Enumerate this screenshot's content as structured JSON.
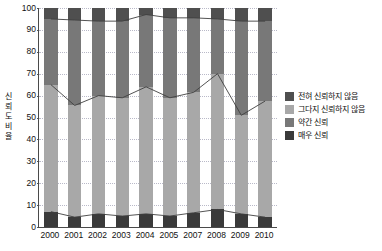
{
  "chart_data": {
    "type": "bar",
    "title": "",
    "subtitle": "",
    "xlabel": "",
    "ylabel": "신뢰도 비율",
    "ylim": [
      0,
      100
    ],
    "yticks": [
      0,
      10,
      20,
      30,
      40,
      50,
      60,
      70,
      80,
      90,
      100
    ],
    "grid": true,
    "stacked": true,
    "legend_position": "right",
    "categories": [
      "2000",
      "2001",
      "2002",
      "2003",
      "2004",
      "2005",
      "2007",
      "2008",
      "2009",
      "2010"
    ],
    "series": [
      {
        "name": "매우 신뢰",
        "color": "#3a3a3a",
        "values": [
          7,
          4.5,
          6,
          5,
          6,
          5,
          6.5,
          8,
          6,
          4.5
        ]
      },
      {
        "name": "약간 신뢰",
        "color": "#a8a8a8",
        "values": [
          58,
          51,
          54,
          54,
          58,
          54,
          55,
          62,
          45,
          53
        ]
      },
      {
        "name": "그다지 신뢰하지 않음",
        "color": "#787878",
        "values": [
          30,
          39,
          34,
          35,
          33,
          36.5,
          34,
          25,
          43,
          36.5
        ]
      },
      {
        "name": "전혀 신뢰하지 않음",
        "color": "#4f4f4f",
        "values": [
          5,
          5.5,
          6,
          6,
          3,
          4.5,
          4.5,
          5,
          6,
          6
        ]
      }
    ],
    "cumulative_boundary_lines": [
      {
        "name": "누적 95 경계선",
        "values": [
          95,
          94.5,
          94,
          94,
          97,
          95.5,
          95.5,
          95,
          94,
          94
        ]
      },
      {
        "name": "누적 65 경계선",
        "values": [
          65,
          55.5,
          60,
          59,
          64,
          59,
          61.5,
          70,
          51,
          57.5
        ]
      },
      {
        "name": "누적 7 경계선",
        "values": [
          7,
          4.5,
          6,
          5,
          6,
          5,
          6.5,
          8,
          6,
          4.5
        ]
      }
    ]
  },
  "legend": {
    "items": [
      {
        "label": "전혀 신뢰하지 않음",
        "color": "#4f4f4f"
      },
      {
        "label": "그다지 신뢰하지 않음",
        "color": "#a8a8a8"
      },
      {
        "label": "약간 신뢰",
        "color": "#787878"
      },
      {
        "label": "매우 신뢰",
        "color": "#3a3a3a"
      }
    ]
  },
  "axis": {
    "y_title_chars": [
      "신",
      "뢰",
      "도",
      "비",
      "율"
    ]
  }
}
